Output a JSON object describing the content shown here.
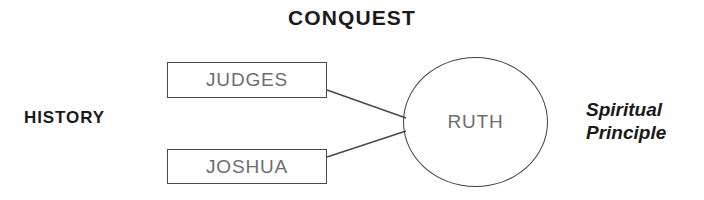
{
  "diagram": {
    "title": "CONQUEST",
    "left_label": "HISTORY",
    "right_label_line1": "Spiritual",
    "right_label_line2": "Principle",
    "boxes": [
      {
        "label": "JUDGES"
      },
      {
        "label": "JOSHUA"
      }
    ],
    "circle": {
      "label": "RUTH"
    },
    "connectors": [
      {
        "from": "JUDGES",
        "to": "RUTH"
      },
      {
        "from": "JOSHUA",
        "to": "RUTH"
      }
    ],
    "colors": {
      "background": "#ffffff",
      "bold_text": "#1a1a1a",
      "node_text": "#6e6e6e",
      "stroke": "#4a4a4a"
    }
  }
}
